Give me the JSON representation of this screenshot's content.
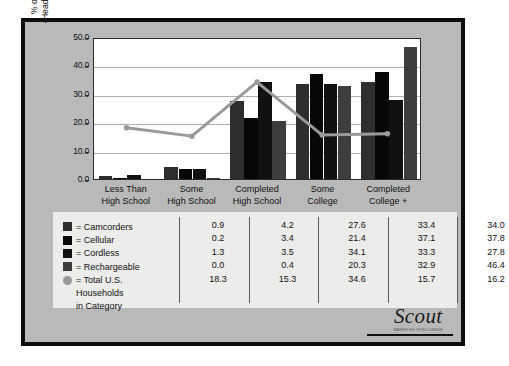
{
  "logo": {
    "word": "Scout",
    "sub": "MARKETING INTELLIGENCE"
  },
  "chart_data": {
    "type": "bar",
    "title": "",
    "xlabel": "",
    "ylabel": "% of Respondents (Heads of Households)",
    "ylabel_line1": "% of Respondents",
    "ylabel_line2": "(Heads of Households)",
    "ylim": [
      0,
      50
    ],
    "ytick_labels": [
      "50.0",
      "40.0",
      "30.0",
      "20.0",
      "10.0",
      "0.0"
    ],
    "ytick_values": [
      50,
      40,
      30,
      20,
      10,
      0
    ],
    "grid": true,
    "legend_position": "below-table",
    "categories": [
      "Less Than High School",
      "Some High School",
      "Completed High School",
      "Some College",
      "Completed College +"
    ],
    "category_lines": [
      [
        "Less Than",
        "High School"
      ],
      [
        "Some",
        "High School"
      ],
      [
        "Completed",
        "High School"
      ],
      [
        "Some",
        "College"
      ],
      [
        "Completed",
        "College +"
      ]
    ],
    "series": [
      {
        "name": "Camcorders",
        "type": "bar",
        "color": "#2e2e2e",
        "values": [
          0.9,
          4.2,
          27.6,
          33.4,
          34.0
        ]
      },
      {
        "name": "Cellular",
        "type": "bar",
        "color": "#070707",
        "values": [
          0.2,
          3.4,
          21.4,
          37.1,
          37.8
        ]
      },
      {
        "name": "Cordless",
        "type": "bar",
        "color": "#111111",
        "values": [
          1.3,
          3.5,
          34.1,
          33.3,
          27.8
        ]
      },
      {
        "name": "Rechargeable",
        "type": "bar",
        "color": "#3d3d3d",
        "values": [
          0.0,
          0.4,
          20.3,
          32.9,
          46.4
        ]
      },
      {
        "name": "Total U.S. Households in Category",
        "type": "line",
        "color": "#9a9a9a",
        "values": [
          18.3,
          15.3,
          34.6,
          15.7,
          16.2
        ]
      }
    ]
  },
  "legend": {
    "rows": [
      {
        "marker": "square",
        "color": "#2e2e2e",
        "label": "= Camcorders"
      },
      {
        "marker": "square",
        "color": "#070707",
        "label": "= Cellular"
      },
      {
        "marker": "square",
        "color": "#111111",
        "label": "= Cordless"
      },
      {
        "marker": "square",
        "color": "#3d3d3d",
        "label": "= Rechargeable"
      },
      {
        "marker": "circle",
        "color": "#9a9a9a",
        "label": "= Total U.S."
      }
    ],
    "continuation": [
      "Households",
      "in Category"
    ]
  },
  "table": {
    "columns": [
      {
        "values": [
          "0.9",
          "0.2",
          "1.3",
          "0.0",
          "18.3"
        ]
      },
      {
        "values": [
          "4.2",
          "3.4",
          "3.5",
          "0.4",
          "15.3"
        ]
      },
      {
        "values": [
          "27.6",
          "21.4",
          "34.1",
          "20.3",
          "34.6"
        ]
      },
      {
        "values": [
          "33.4",
          "37.1",
          "33.3",
          "32.9",
          "15.7"
        ]
      },
      {
        "values": [
          "34.0",
          "37.8",
          "27.8",
          "46.4",
          "16.2"
        ]
      }
    ]
  }
}
